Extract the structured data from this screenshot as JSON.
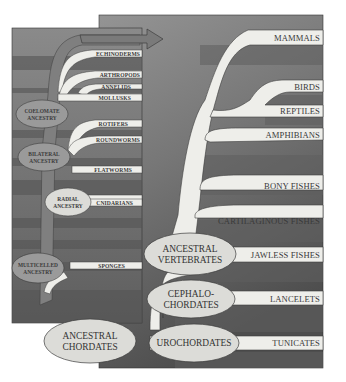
{
  "diagram": {
    "type": "phylogenetic-tree",
    "inset_panel": {
      "title": "Invertebrate lineages",
      "nodes": [
        {
          "id": "coelomate",
          "lines": [
            "COELOMATE",
            "ANCESTRY"
          ]
        },
        {
          "id": "bilateral",
          "lines": [
            "BILATERAL",
            "ANCESTRY"
          ]
        },
        {
          "id": "radial",
          "lines": [
            "RADIAL",
            "ANCESTRY"
          ]
        },
        {
          "id": "multicelled",
          "lines": [
            "MULTICELLED",
            "ANCESTRY"
          ]
        }
      ],
      "labels": [
        "ECHINODERMS",
        "ARTHROPODS",
        "ANNELIDS",
        "MOLLUSKS",
        "ROTIFERS",
        "ROUNDWORMS",
        "FLATWORMS",
        "CNIDARIANS",
        "SPONGES"
      ],
      "arrow_target": "chordates"
    },
    "main_panel": {
      "nodes": [
        {
          "id": "ancestral_vertebrates",
          "lines": [
            "ANCESTRAL",
            "VERTEBRATES"
          ]
        },
        {
          "id": "cephalochordates",
          "lines": [
            "CEPHALO-",
            "CHORDATES"
          ]
        },
        {
          "id": "urochordates",
          "lines": [
            "UROCHORDATES"
          ]
        },
        {
          "id": "ancestral_chordates",
          "lines": [
            "ANCESTRAL",
            "CHORDATES"
          ]
        }
      ],
      "labels": [
        "MAMMALS",
        "BIRDS",
        "REPTILES",
        "AMPHIBIANS",
        "BONY FISHES",
        "CARTILAGINOUS FISHES",
        "JAWLESS FISHES",
        "LANCELETS",
        "TUNICATES"
      ]
    },
    "colors": {
      "panel_light": "#8c8c8c",
      "panel_dark": "#5a5a5a",
      "inset_panel": "#6e6e6e",
      "branch": "#eeeeea",
      "node_fill": "#dcdcd8",
      "node_dark_fill": "#9a9a9a",
      "text": "#3a3a3a"
    }
  }
}
